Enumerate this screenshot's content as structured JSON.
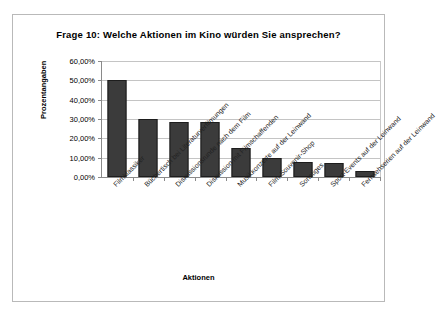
{
  "figure": {
    "title": "Frage 10: Welche Aktionen im Kino würden Sie ansprechen?",
    "background_color": "#ffffff",
    "border_color": "#b9b9b9"
  },
  "chart_data": {
    "type": "bar",
    "title": "Frage 10: Welche Aktionen im Kino würden Sie ansprechen?",
    "xlabel": "Aktionen",
    "ylabel": "Prozentangaben",
    "categories": [
      "Filmklassiker",
      "Büchertisch bei Literaturverfilmungen",
      "Diskussionsrunde nach dem Film",
      "Diskussion mit Filmschaffenden",
      "Musikkonzerte auf der Leinwand",
      "Film-Souvenir-Shop",
      "Sonstiges",
      "Sport-Events auf der Leinwand",
      "Fernsehserien auf der Leinwand"
    ],
    "values": [
      50.0,
      30.0,
      28.5,
      28.5,
      15.0,
      10.0,
      7.8,
      7.0,
      3.0
    ],
    "value_labels": [
      "50,00%",
      "30,00%",
      "28,50%",
      "28,50%",
      "15,00%",
      "10,00%",
      "7,80%",
      "7,00%",
      "3,00%"
    ],
    "ylim": [
      0,
      60
    ],
    "ytick_values": [
      0,
      10,
      20,
      30,
      40,
      50,
      60
    ],
    "ytick_labels": [
      "0,00%",
      "10,00%",
      "20,00%",
      "30,00%",
      "40,00%",
      "50,00%",
      "60,00%"
    ],
    "grid": true,
    "grid_axis": "y",
    "legend": false,
    "bar_color": "#3b3b3b",
    "bar_edge_color": "#1d1d1d",
    "axis_color": "#8a8a8a",
    "gridline_color": "#c4c4c4",
    "category_label_rotation": -45
  }
}
